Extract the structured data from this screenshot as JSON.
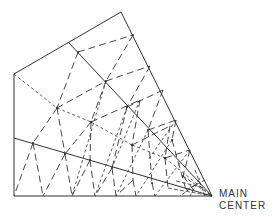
{
  "diagram": {
    "type": "radial-mesh",
    "labels": {
      "center_line1": "MAIN",
      "center_line2": "CENTER"
    },
    "colors": {
      "line": "#333333",
      "background": "#ffffff"
    },
    "outline": [
      [
        121,
        12
      ],
      [
        212,
        196
      ],
      [
        14,
        196
      ],
      [
        14,
        74
      ],
      [
        121,
        12
      ]
    ],
    "solid_lines": [
      [
        [
          69,
          43
        ],
        [
          212,
          196
        ]
      ],
      [
        [
          14,
          138
        ],
        [
          212,
          196
        ]
      ]
    ],
    "line_styles": [
      "solid",
      "long-dash",
      "short-dash"
    ]
  }
}
